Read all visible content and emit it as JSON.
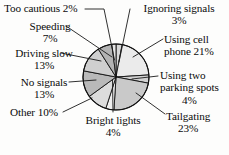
{
  "chart_data": {
    "type": "pie",
    "title": "",
    "subtitle": "",
    "xlabel": "",
    "ylabel": "",
    "legend_position": "none",
    "grid": false,
    "labels_show_percent": true,
    "total_percent": 100,
    "categories": [
      "Ignoring signals",
      "Using cell phone",
      "Using two parking spots",
      "Tailgating",
      "Bright lights",
      "Other",
      "No signals",
      "Driving slow",
      "Speeding",
      "Too cautious"
    ],
    "values": [
      3,
      21,
      4,
      23,
      4,
      10,
      13,
      13,
      7,
      2
    ],
    "slices": [
      {
        "label": "Ignoring signals",
        "value": 3,
        "percent_text": "3%",
        "fill": "#d8d8d8"
      },
      {
        "label": "Using cell phone",
        "value": 21,
        "percent_text": "21%",
        "fill": "#ebebeb"
      },
      {
        "label": "Using two parking spots",
        "value": 4,
        "percent_text": "4%",
        "fill": "#d2d2d2"
      },
      {
        "label": "Tailgating",
        "value": 23,
        "percent_text": "23%",
        "fill": "#c9c9c9"
      },
      {
        "label": "Bright lights",
        "value": 4,
        "percent_text": "4%",
        "fill": "#efefef"
      },
      {
        "label": "Other",
        "value": 10,
        "percent_text": "10%",
        "fill": "#dcdcdc"
      },
      {
        "label": "No signals",
        "value": 13,
        "percent_text": "13%",
        "fill": "#b9b9b9"
      },
      {
        "label": "Driving slow",
        "value": 13,
        "percent_text": "13%",
        "fill": "#cfcfcf"
      },
      {
        "label": "Speeding",
        "value": 7,
        "percent_text": "7%",
        "fill": "#b3b3b3"
      },
      {
        "label": "Too cautious",
        "value": 2,
        "percent_text": "2%",
        "fill": "#e4e4e4"
      }
    ]
  },
  "labels": {
    "too_cautious": {
      "line1": "Too cautious 2%"
    },
    "speeding": {
      "line1": "Speeding",
      "line2": "7%"
    },
    "driving_slow": {
      "line1": "Driving slow",
      "line2": "13%"
    },
    "no_signals": {
      "line1": "No signals",
      "line2": "13%"
    },
    "other": {
      "line1": "Other 10%"
    },
    "bright_lights": {
      "line1": "Bright lights",
      "line2": "4%"
    },
    "ignoring": {
      "line1": "Ignoring signals",
      "line2": "3%"
    },
    "cell_phone": {
      "line1": "Using cell",
      "line2": "phone 21%"
    },
    "parking": {
      "line1": "Using two",
      "line2": "parking spots",
      "line3": "4%"
    },
    "tailgating": {
      "line1": "Tailgating",
      "line2": "23%"
    }
  },
  "style": {
    "outline_color": "#111111",
    "background": "#fdfdfc",
    "leader_line_color": "#1a1a1a"
  }
}
